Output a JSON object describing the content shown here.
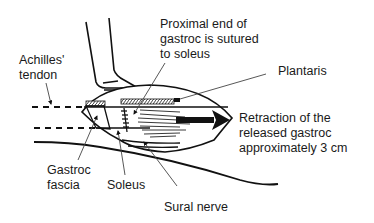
{
  "diagram": {
    "type": "anatomical-schematic",
    "colors": {
      "line": "#111111",
      "leader": "#555555",
      "background": "#ffffff"
    },
    "labels": {
      "proximal_end": {
        "lines": [
          "Proximal end of",
          "gastroc is sutured",
          "to soleus"
        ]
      },
      "achilles": {
        "lines": [
          "Achilles'",
          "tendon"
        ]
      },
      "plantaris": {
        "lines": [
          "Plantaris"
        ]
      },
      "retraction": {
        "lines": [
          "Retraction of the",
          "released gastroc",
          "approximately 3 cm"
        ]
      },
      "gastroc_fascia": {
        "lines": [
          "Gastroc",
          "fascia"
        ]
      },
      "soleus": {
        "lines": [
          "Soleus"
        ]
      },
      "sural_nerve": {
        "lines": [
          "Sural nerve"
        ]
      }
    }
  }
}
